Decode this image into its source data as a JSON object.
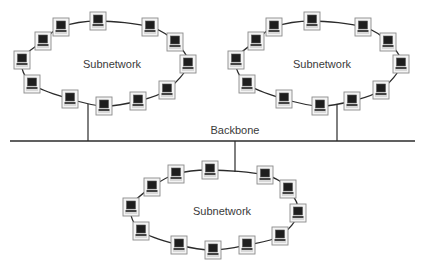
{
  "diagram": {
    "type": "network-topology",
    "backbone": {
      "label": "Backbone",
      "y": 141,
      "x_start": 10,
      "x_end": 415,
      "taps": [
        {
          "ring": 0,
          "x": 88,
          "y_top": 104
        },
        {
          "ring": 1,
          "x": 337,
          "y_top": 104
        },
        {
          "ring": 2,
          "x": 235,
          "y_bottom": 172
        }
      ]
    },
    "subnetworks": [
      {
        "label": "Subnetwork",
        "label_pos": [
          112,
          68
        ],
        "ring": {
          "cx": 105,
          "cy": 63,
          "rx": 85,
          "ry": 43
        },
        "nodes": [
          [
            98,
            21
          ],
          [
            61,
            27
          ],
          [
            43,
            41
          ],
          [
            22,
            60
          ],
          [
            32,
            84
          ],
          [
            70,
            99
          ],
          [
            104,
            106
          ],
          [
            138,
            101
          ],
          [
            167,
            90
          ],
          [
            188,
            64
          ],
          [
            175,
            42
          ],
          [
            150,
            27
          ]
        ]
      },
      {
        "label": "Subnetwork",
        "label_pos": [
          322,
          68
        ],
        "ring": {
          "cx": 318,
          "cy": 63,
          "rx": 84,
          "ry": 43
        },
        "nodes": [
          [
            312,
            21
          ],
          [
            274,
            27
          ],
          [
            256,
            41
          ],
          [
            236,
            60
          ],
          [
            247,
            84
          ],
          [
            284,
            99
          ],
          [
            320,
            106
          ],
          [
            352,
            101
          ],
          [
            381,
            90
          ],
          [
            401,
            64
          ],
          [
            388,
            42
          ],
          [
            363,
            27
          ]
        ]
      },
      {
        "label": "Subnetwork",
        "label_pos": [
          222,
          215
        ],
        "ring": {
          "cx": 215,
          "cy": 210,
          "rx": 84,
          "ry": 40
        },
        "nodes": [
          [
            210,
            170
          ],
          [
            176,
            174
          ],
          [
            152,
            187
          ],
          [
            131,
            207
          ],
          [
            141,
            231
          ],
          [
            179,
            245
          ],
          [
            213,
            250
          ],
          [
            247,
            245
          ],
          [
            280,
            236
          ],
          [
            298,
            213
          ],
          [
            288,
            189
          ],
          [
            265,
            175
          ]
        ]
      }
    ],
    "node_icon": "computer-terminal-icon",
    "colors": {
      "line": "#2b2b2b",
      "node_frame": "#8a8a8a",
      "node_fill": "#f4f4f4",
      "screen": "#1e1e1e",
      "text": "#3a3a3a"
    }
  }
}
